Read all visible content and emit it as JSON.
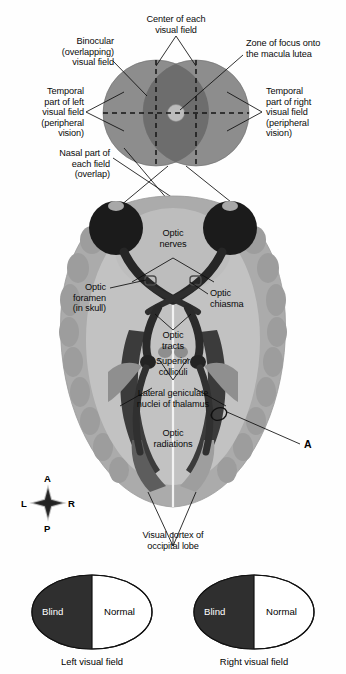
{
  "figure": {
    "type": "anatomical-diagram"
  },
  "visual_field_diagram": {
    "name": "binocular-visual-field",
    "labels": {
      "center_of_each_visual_field": "Center of each\nvisual field",
      "binocular_overlapping_visual_field": "Binocular\n(overlapping)\nvisual field",
      "zone_of_focus": "Zone of focus onto\nthe macula lutea",
      "temporal_left": "Temporal\npart of left\nvisual field\n(peripheral\nvision)",
      "temporal_right": "Temporal\npart of right\nvisual field\n(peripheral\nvision)",
      "nasal_part": "Nasal part of\neach field\n(overlap)"
    },
    "colors": {
      "peripheral_field": "#8a8a8a",
      "binocular_overlap": "#6f6f6f",
      "macula_zone": "#b9b9b9",
      "dashed_line": "#141414"
    }
  },
  "brain_diagram": {
    "name": "transverse-brain-section",
    "labels": {
      "optic_nerves": "Optic\nnerves",
      "optic_foramen": "Optic\nforamen\n(in skull)",
      "optic_chiasma": "Optic\nchiasma",
      "optic_tracts": "Optic\ntracts",
      "superior_colliculi": "Superior\ncolliculi",
      "lateral_geniculate": "Lateral geniculate\nnuclei of thalamus",
      "optic_radiations": "Optic\nradiations",
      "visual_cortex": "Visual cortex of\noccipital lobe"
    },
    "lesion_marker": "A",
    "compass": {
      "anterior": "A",
      "posterior": "P",
      "left": "L",
      "right": "R"
    },
    "colors": {
      "cortex_outer": "#a9a9a9",
      "cortex_inner": "#bdbdbd",
      "white_matter": "#cfcfcf",
      "ventricle_dark": "#3a3a3a",
      "tract_dark": "#2b2b2b",
      "eye_dark": "#1c1c1c"
    }
  },
  "field_defect_diagrams": [
    {
      "name": "left-visual-field",
      "blind_label": "Blind",
      "normal_label": "Normal",
      "caption": "Left visual field",
      "blind_side": "left"
    },
    {
      "name": "right-visual-field",
      "blind_label": "Blind",
      "normal_label": "Normal",
      "caption": "Right visual field",
      "blind_side": "left"
    }
  ],
  "palette": {
    "blind_fill": "#2e2e2e",
    "normal_fill": "#ffffff",
    "outline": "#111111"
  }
}
